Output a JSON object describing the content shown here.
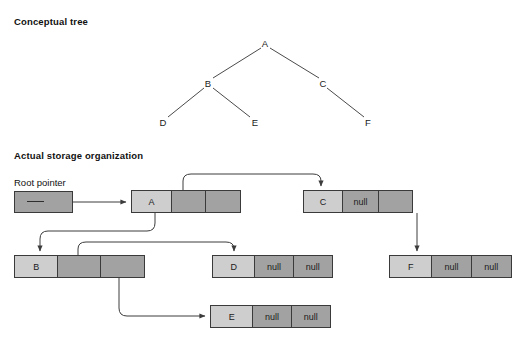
{
  "figure": {
    "section_conceptual_title": "Conceptual tree",
    "section_storage_title": "Actual storage organization",
    "root_pointer_label": "Root pointer",
    "null_text": "null",
    "colors": {
      "data_cell": "#cecece",
      "pointer_cell": "#a2a2a2",
      "border": "#3a3a3a",
      "line": "#3c3c3c",
      "text": "#111111",
      "background": "#ffffff"
    }
  },
  "conceptual_tree": {
    "nodes": [
      {
        "id": "A",
        "label": "A",
        "x": 265,
        "y": 43
      },
      {
        "id": "B",
        "label": "B",
        "x": 208,
        "y": 83
      },
      {
        "id": "C",
        "label": "C",
        "x": 323,
        "y": 83
      },
      {
        "id": "D",
        "label": "D",
        "x": 163,
        "y": 122
      },
      {
        "id": "E",
        "label": "E",
        "x": 255,
        "y": 122
      },
      {
        "id": "F",
        "label": "F",
        "x": 368,
        "y": 122
      }
    ],
    "edges": [
      {
        "from": "A",
        "to": "B"
      },
      {
        "from": "A",
        "to": "C"
      },
      {
        "from": "B",
        "to": "D"
      },
      {
        "from": "B",
        "to": "E"
      },
      {
        "from": "C",
        "to": "F"
      }
    ]
  },
  "storage": {
    "records": [
      {
        "id": "A",
        "data": "A",
        "left": "pointer-to-B",
        "right": "pointer-to-C"
      },
      {
        "id": "C",
        "data": "C",
        "left": "null",
        "right": "pointer-to-F"
      },
      {
        "id": "B",
        "data": "B",
        "left": "pointer-to-D",
        "right": "pointer-to-E"
      },
      {
        "id": "D",
        "data": "D",
        "left": "null",
        "right": "null"
      },
      {
        "id": "F",
        "data": "F",
        "left": "null",
        "right": "null"
      },
      {
        "id": "E",
        "data": "E",
        "left": "null",
        "right": "null"
      }
    ],
    "cell_text": {
      "a_data": "A",
      "a_left": "",
      "a_right": "",
      "c_data": "C",
      "c_left": "null",
      "c_right": "",
      "b_data": "B",
      "b_left": "",
      "b_right": "",
      "d_data": "D",
      "d_left": "null",
      "d_right": "null",
      "f_data": "F",
      "f_left": "null",
      "f_right": "null",
      "e_data": "E",
      "e_left": "null",
      "e_right": "null"
    },
    "pointers": [
      {
        "from": "root-pointer",
        "to": "A"
      },
      {
        "from": "A.left",
        "to": "B"
      },
      {
        "from": "A.right",
        "to": "C"
      },
      {
        "from": "B.left",
        "to": "D"
      },
      {
        "from": "B.right",
        "to": "E"
      },
      {
        "from": "C.right",
        "to": "F"
      }
    ]
  }
}
